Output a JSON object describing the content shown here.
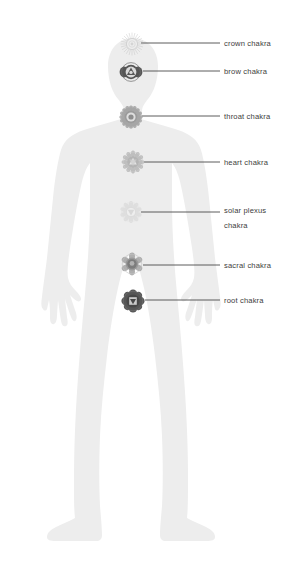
{
  "diagram": {
    "background_color": "#ffffff",
    "figure": {
      "name": "human-body-silhouette",
      "fill_color": "#ededed",
      "pose": "standing front view, arms at sides"
    },
    "label_style": {
      "text_color": "#3d3d3d",
      "leader_line_color": "#4a4a4a",
      "font_size_px": 7.6
    },
    "chakras": [
      {
        "id": "crown",
        "label": "crown chakra",
        "label_line2": "",
        "symbol_color": "#c9c9c9",
        "opacity": 0.55,
        "petals": 24,
        "marker_x": 132,
        "marker_y": 44,
        "line_start_x": 141,
        "line_y": 43,
        "line_end_x": 220,
        "label_x": 224,
        "label_y": 45.5
      },
      {
        "id": "brow",
        "label": "brow chakra",
        "label_line2": "",
        "symbol_color": "#4e4e4e",
        "opacity": 0.95,
        "petals": 2,
        "marker_x": 131,
        "marker_y": 72,
        "line_start_x": 143,
        "line_y": 71,
        "line_end_x": 220,
        "label_x": 224,
        "label_y": 73.5
      },
      {
        "id": "throat",
        "label": "throat chakra",
        "label_line2": "",
        "symbol_color": "#8d8d8d",
        "opacity": 0.85,
        "petals": 16,
        "marker_x": 131,
        "marker_y": 117,
        "line_start_x": 142,
        "line_y": 116,
        "line_end_x": 220,
        "label_x": 224,
        "label_y": 118.5
      },
      {
        "id": "heart",
        "label": "heart chakra",
        "label_line2": "",
        "symbol_color": "#b0b0b0",
        "opacity": 0.8,
        "petals": 12,
        "marker_x": 133,
        "marker_y": 162,
        "line_start_x": 144,
        "line_y": 162,
        "line_end_x": 220,
        "label_x": 224,
        "label_y": 164.5
      },
      {
        "id": "solar-plexus",
        "label": "solar plexus",
        "label_line2": "chakra",
        "symbol_color": "#d6d6d6",
        "opacity": 0.6,
        "petals": 10,
        "marker_x": 131,
        "marker_y": 212,
        "line_start_x": 141,
        "line_y": 212,
        "line_end_x": 220,
        "label_x": 224,
        "label_y": 212.5
      },
      {
        "id": "sacral",
        "label": "sacral chakra",
        "label_line2": "",
        "symbol_color": "#9a9a9a",
        "opacity": 0.9,
        "petals": 6,
        "marker_x": 132,
        "marker_y": 264,
        "line_start_x": 143,
        "line_y": 265,
        "line_end_x": 220,
        "label_x": 224,
        "label_y": 267.5
      },
      {
        "id": "root",
        "label": "root chakra",
        "label_line2": "",
        "symbol_color": "#4a4a4a",
        "opacity": 0.95,
        "petals": 4,
        "marker_x": 133,
        "marker_y": 301,
        "line_start_x": 145,
        "line_y": 300,
        "line_end_x": 220,
        "label_x": 224,
        "label_y": 302.5
      }
    ]
  }
}
